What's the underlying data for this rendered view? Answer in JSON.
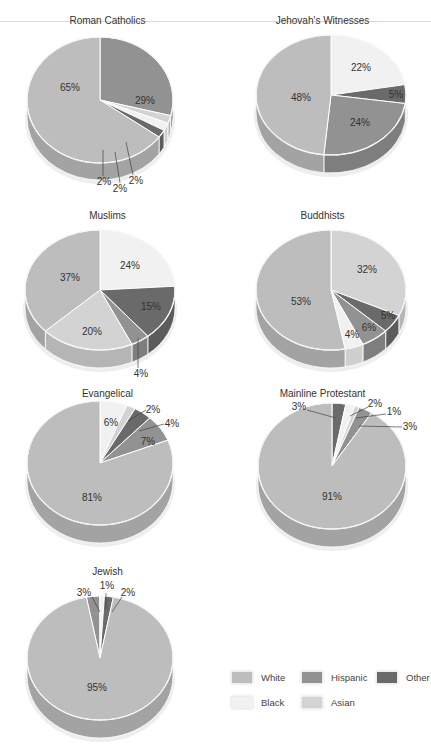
{
  "colors": {
    "White": "#bdbdbd",
    "Hispanic": "#929292",
    "Other": "#6a6a6a",
    "Black": "#f1f1f1",
    "Asian": "#d3d3d3"
  },
  "legend": {
    "items": [
      {
        "label": "White",
        "key": "White"
      },
      {
        "label": "Hispanic",
        "key": "Hispanic"
      },
      {
        "label": "Other",
        "key": "Other"
      },
      {
        "label": "Black",
        "key": "Black"
      },
      {
        "label": "Asian",
        "key": "Asian"
      }
    ]
  },
  "chart_data": [
    {
      "type": "pie",
      "title": "Roman Catholics",
      "start_angle": 0,
      "slices": [
        {
          "category": "Hispanic",
          "value": 29,
          "label": "29%"
        },
        {
          "category": "Asian",
          "value": 2,
          "label": "2%"
        },
        {
          "category": "Black",
          "value": 2,
          "label": "2%"
        },
        {
          "category": "Other",
          "value": 2,
          "label": "2%"
        },
        {
          "category": "White",
          "value": 65,
          "label": "65%"
        }
      ]
    },
    {
      "type": "pie",
      "title": "Jehovah's Witnesses",
      "start_angle": 0,
      "slices": [
        {
          "category": "Black",
          "value": 22,
          "label": "22%"
        },
        {
          "category": "Other",
          "value": 5,
          "label": "5%"
        },
        {
          "category": "Hispanic",
          "value": 24,
          "label": "24%"
        },
        {
          "category": "White",
          "value": 48,
          "label": "48%"
        }
      ]
    },
    {
      "type": "pie",
      "title": "Muslims",
      "start_angle": 0,
      "slices": [
        {
          "category": "Black",
          "value": 24,
          "label": "24%"
        },
        {
          "category": "Other",
          "value": 15,
          "label": "15%"
        },
        {
          "category": "Hispanic",
          "value": 4,
          "label": "4%"
        },
        {
          "category": "Asian",
          "value": 20,
          "label": "20%"
        },
        {
          "category": "White",
          "value": 37,
          "label": "37%"
        }
      ]
    },
    {
      "type": "pie",
      "title": "Buddhists",
      "start_angle": 0,
      "slices": [
        {
          "category": "Asian",
          "value": 32,
          "label": "32%"
        },
        {
          "category": "Other",
          "value": 5,
          "label": "5%"
        },
        {
          "category": "Hispanic",
          "value": 6,
          "label": "6%"
        },
        {
          "category": "Black",
          "value": 4,
          "label": "4%"
        },
        {
          "category": "White",
          "value": 53,
          "label": "53%"
        }
      ]
    },
    {
      "type": "pie",
      "title": "Evangelical",
      "start_angle": 0,
      "slices": [
        {
          "category": "Black",
          "value": 6,
          "label": "6%"
        },
        {
          "category": "Asian",
          "value": 2,
          "label": "2%"
        },
        {
          "category": "Other",
          "value": 4,
          "label": "4%"
        },
        {
          "category": "Hispanic",
          "value": 7,
          "label": "7%"
        },
        {
          "category": "White",
          "value": 81,
          "label": "81%"
        }
      ]
    },
    {
      "type": "pie",
      "title": "Mainline Protestant",
      "start_angle": 0,
      "slices": [
        {
          "category": "Other",
          "value": 3,
          "label": "3%"
        },
        {
          "category": "Black",
          "value": 2,
          "label": "2%"
        },
        {
          "category": "Asian",
          "value": 1,
          "label": "1%"
        },
        {
          "category": "Hispanic",
          "value": 3,
          "label": "3%"
        },
        {
          "category": "White",
          "value": 91,
          "label": "91%"
        }
      ]
    },
    {
      "type": "pie",
      "title": "Jewish",
      "start_angle": -10.8,
      "slices": [
        {
          "category": "Hispanic",
          "value": 3,
          "label": "3%"
        },
        {
          "category": "Black",
          "value": 1,
          "label": "1%"
        },
        {
          "category": "Other",
          "value": 2,
          "label": "2%"
        },
        {
          "category": "White",
          "value": 95,
          "label": "95%"
        }
      ]
    }
  ],
  "layout": {
    "charts": [
      {
        "left": 0,
        "top": 0,
        "title_top": 15,
        "cx": 100,
        "cy": 100,
        "rx": 73,
        "ry": 63,
        "depth": 17,
        "labels": [
          {
            "i": 0,
            "x": 145,
            "y": 104
          },
          {
            "i": 4,
            "x": 70,
            "y": 91
          },
          {
            "i": 3,
            "x": 104,
            "y": 185,
            "lx1": 103,
            "ly1": 150,
            "lx2": 103,
            "ly2": 176
          },
          {
            "i": 2,
            "x": 120,
            "y": 192,
            "lx1": 115,
            "ly1": 152,
            "lx2": 120,
            "ly2": 183
          },
          {
            "i": 1,
            "x": 136,
            "y": 184,
            "lx1": 126,
            "ly1": 142,
            "lx2": 133,
            "ly2": 175
          }
        ]
      },
      {
        "left": 215,
        "top": 0,
        "title_top": 15,
        "cx": 116,
        "cy": 95,
        "rx": 75,
        "ry": 60,
        "depth": 18,
        "labels": [
          {
            "i": 0,
            "x": 146,
            "y": 71
          },
          {
            "i": 1,
            "x": 181,
            "y": 98
          },
          {
            "i": 2,
            "x": 145,
            "y": 126
          },
          {
            "i": 3,
            "x": 86,
            "y": 101
          }
        ]
      },
      {
        "left": 0,
        "top": 195,
        "title_top": 15,
        "cx": 100,
        "cy": 95,
        "rx": 75,
        "ry": 60,
        "depth": 18,
        "labels": [
          {
            "i": 0,
            "x": 130,
            "y": 74
          },
          {
            "i": 1,
            "x": 151,
            "y": 115
          },
          {
            "i": 3,
            "x": 92,
            "y": 140
          },
          {
            "i": 4,
            "x": 70,
            "y": 86
          },
          {
            "i": 2,
            "x": 141,
            "y": 182,
            "lx1": 138,
            "ly1": 143,
            "lx2": 138,
            "ly2": 173
          }
        ]
      },
      {
        "left": 215,
        "top": 195,
        "title_top": 15,
        "cx": 116,
        "cy": 95,
        "rx": 75,
        "ry": 60,
        "depth": 18,
        "labels": [
          {
            "i": 0,
            "x": 152,
            "y": 78
          },
          {
            "i": 1,
            "x": 173,
            "y": 124
          },
          {
            "i": 2,
            "x": 154,
            "y": 136
          },
          {
            "i": 3,
            "x": 137,
            "y": 143
          },
          {
            "i": 4,
            "x": 86,
            "y": 110
          }
        ]
      },
      {
        "left": 0,
        "top": 380,
        "title_top": 8,
        "cx": 100,
        "cy": 83,
        "rx": 73,
        "ry": 62,
        "depth": 18,
        "labels": [
          {
            "i": 0,
            "x": 111,
            "y": 46
          },
          {
            "i": 1,
            "x": 153,
            "y": 33,
            "lx1": 128,
            "ly1": 41,
            "lx2": 146,
            "ly2": 30
          },
          {
            "i": 2,
            "x": 172,
            "y": 47,
            "lx1": 139,
            "ly1": 51,
            "lx2": 164,
            "ly2": 44
          },
          {
            "i": 3,
            "x": 148,
            "y": 65
          },
          {
            "i": 4,
            "x": 92,
            "y": 121
          }
        ]
      },
      {
        "left": 215,
        "top": 380,
        "title_top": 8,
        "cx": 117,
        "cy": 86,
        "rx": 74,
        "ry": 63,
        "depth": 18,
        "labels": [
          {
            "i": 0,
            "x": 84,
            "y": 30,
            "lx1": 92,
            "ly1": 30,
            "lx2": 121,
            "ly2": 38
          },
          {
            "i": 1,
            "x": 160,
            "y": 27,
            "lx1": 153,
            "ly1": 27,
            "lx2": 135,
            "ly2": 36
          },
          {
            "i": 2,
            "x": 179,
            "y": 35,
            "lx1": 171,
            "ly1": 34,
            "lx2": 141,
            "ly2": 38
          },
          {
            "i": 3,
            "x": 195,
            "y": 50,
            "lx1": 187,
            "ly1": 47,
            "lx2": 144,
            "ly2": 46
          },
          {
            "i": 4,
            "x": 117,
            "y": 120
          }
        ]
      },
      {
        "left": 0,
        "top": 560,
        "title_top": 6,
        "cx": 100,
        "cy": 98,
        "rx": 73,
        "ry": 62,
        "depth": 18,
        "labels": [
          {
            "i": 0,
            "x": 84,
            "y": 36,
            "lx1": 92,
            "ly1": 37,
            "lx2": 100,
            "ly2": 52
          },
          {
            "i": 1,
            "x": 107,
            "y": 29,
            "lx1": 106,
            "ly1": 33,
            "lx2": 106,
            "ly2": 49
          },
          {
            "i": 2,
            "x": 128,
            "y": 36,
            "lx1": 122,
            "ly1": 37,
            "lx2": 112,
            "ly2": 52
          },
          {
            "i": 3,
            "x": 97,
            "y": 131
          }
        ]
      }
    ]
  }
}
